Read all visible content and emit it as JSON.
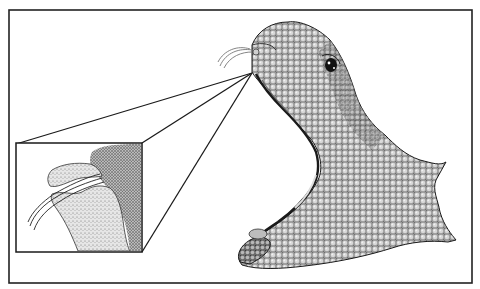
{
  "figure": {
    "type": "scientific-illustration",
    "style": "black-and-white stipple pen drawing",
    "colors": {
      "background": "#ffffff",
      "ink": "#1a1a1a",
      "frame": "#222222",
      "stipple_light": "#c8c8c8",
      "stipple_mid": "#8f8f8f",
      "stipple_dark": "#4a4a4a"
    },
    "frame": {
      "x": 9,
      "y": 10,
      "width": 463,
      "height": 273
    },
    "inset": {
      "x": 16,
      "y": 143,
      "width": 126,
      "height": 109
    },
    "callout_origin": {
      "x": 252,
      "y": 73
    },
    "elements": [
      {
        "name": "outer-frame"
      },
      {
        "name": "magnified-fang-inset"
      },
      {
        "name": "callout-lines"
      },
      {
        "name": "snake-head"
      },
      {
        "name": "snake-eye"
      },
      {
        "name": "fangs"
      },
      {
        "name": "lower-jaw"
      }
    ]
  }
}
